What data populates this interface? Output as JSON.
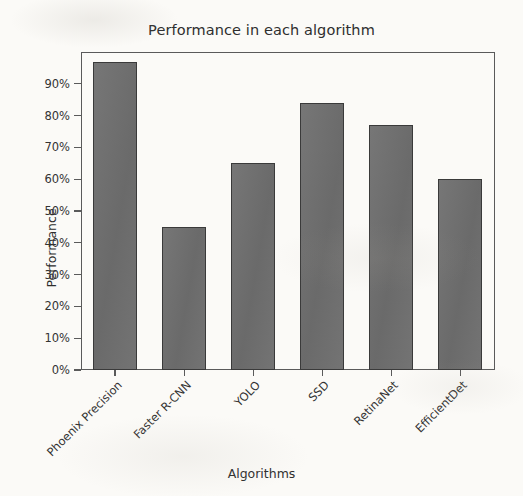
{
  "chart_data": {
    "type": "bar",
    "title": "Performance in each algorithm",
    "xlabel": "Algorithms",
    "ylabel": "Performance",
    "categories": [
      "Phoenix Precision",
      "Faster R-CNN",
      "YOLO",
      "SSD",
      "RetinaNet",
      "EfficientDet"
    ],
    "values": [
      97,
      45,
      65,
      84,
      77,
      60
    ],
    "value_labels": [
      "97%",
      "45%",
      "65%",
      "84%",
      "77%",
      "60%"
    ],
    "ylim": [
      0,
      100
    ],
    "ytick_values": [
      0,
      10,
      20,
      30,
      40,
      50,
      60,
      70,
      80,
      90
    ],
    "ytick_labels": [
      "0%",
      "10%",
      "20%",
      "30%",
      "40%",
      "50%",
      "60%",
      "70%",
      "80%",
      "90%"
    ],
    "grid": false,
    "legend": false,
    "bar_color": "#6f6f6f",
    "bar_edge_color": "#3a3a3a",
    "axis_color": "#5a5a5a",
    "background_color": "#fbfaf7",
    "xtick_label_rotation": -45
  }
}
